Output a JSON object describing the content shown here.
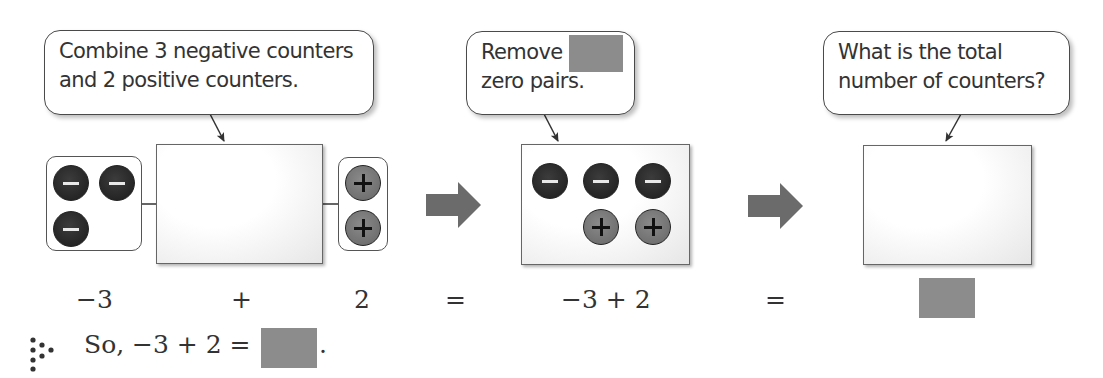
{
  "step1": {
    "callout": [
      "Combine 3 negative counters",
      "and 2 positive counters."
    ],
    "left_group": {
      "counters": [
        "negative",
        "negative",
        "negative"
      ]
    },
    "right_group": {
      "counters": [
        "positive",
        "positive"
      ]
    },
    "equation_parts": {
      "left": "−3",
      "op": "+",
      "right": "2"
    }
  },
  "step2": {
    "callout_line1": "Remove",
    "callout_line2": "zero pairs.",
    "callout_blank": "",
    "mat_counters": {
      "top_row": [
        "negative",
        "negative",
        "negative"
      ],
      "bottom_row": [
        "positive",
        "positive"
      ]
    },
    "expression": "−3 + 2"
  },
  "step3": {
    "callout": [
      "What is the total",
      "number of counters?"
    ],
    "mat_counters": [],
    "answer_blank": ""
  },
  "equals_sign": "=",
  "conclusion": {
    "icon": "therefore-dots-icon",
    "text": "So, −3 + 2 =",
    "blank": "",
    "end": "."
  },
  "colors": {
    "negative_counter": "#2a2a2a",
    "positive_counter": "#777777",
    "blank_fill": "#8c8c8c",
    "arrow_fill": "#6b6b6b"
  }
}
